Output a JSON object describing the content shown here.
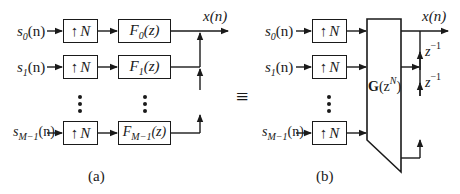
{
  "figure": {
    "panel_a": {
      "caption": "(a)",
      "inputs": [
        {
          "name": "s",
          "sub": "0",
          "arg": "(n)"
        },
        {
          "name": "s",
          "sub": "1",
          "arg": "(n)"
        },
        {
          "name": "s",
          "sub": "M−1",
          "arg": "(n)"
        }
      ],
      "upsampler_label": "N",
      "upsampler_arrow": "↑",
      "filters": [
        {
          "name": "F",
          "sub": "0",
          "arg": "(z)"
        },
        {
          "name": "F",
          "sub": "1",
          "arg": "(z)"
        },
        {
          "name": "F",
          "sub": "M−1",
          "arg": "(z)"
        }
      ],
      "output": "x(n)"
    },
    "equivalence_symbol": "≡",
    "panel_b": {
      "caption": "(b)",
      "inputs": [
        {
          "name": "s",
          "sub": "0",
          "arg": "(n)"
        },
        {
          "name": "s",
          "sub": "1",
          "arg": "(n)"
        },
        {
          "name": "s",
          "sub": "M−1",
          "arg": "(n)"
        }
      ],
      "upsampler_label": "N",
      "upsampler_arrow": "↑",
      "polyphase_block": {
        "bold": "G",
        "arg_open": "(z",
        "sup": "N",
        "arg_close": ")"
      },
      "delays": [
        {
          "base": "z",
          "sup": "−1"
        },
        {
          "base": "z",
          "sup": "−1"
        }
      ],
      "output": "x(n)"
    }
  }
}
